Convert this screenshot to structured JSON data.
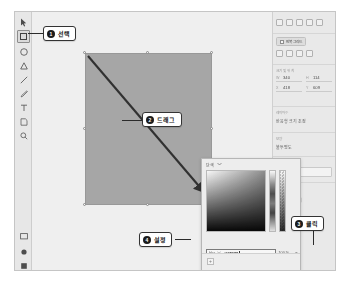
{
  "app": {
    "title": "Design Tool Canvas"
  },
  "toolbar": {
    "name": "tools-panel",
    "items": [
      {
        "icon": "cursor-icon",
        "label": "선택 도구",
        "active": false
      },
      {
        "icon": "rectangle-icon",
        "label": "사각형 도구",
        "active": true
      },
      {
        "icon": "ellipse-icon",
        "label": "타원 도구",
        "active": false
      },
      {
        "icon": "triangle-icon",
        "label": "다각형 도구",
        "active": false
      },
      {
        "icon": "line-icon",
        "label": "선 도구",
        "active": false
      },
      {
        "icon": "pen-icon",
        "label": "펜 도구",
        "active": false
      },
      {
        "icon": "text-icon",
        "label": "텍스트 도구",
        "active": false
      },
      {
        "icon": "artboard-icon",
        "label": "아트보드 도구",
        "active": false
      },
      {
        "icon": "zoom-icon",
        "label": "확대 도구",
        "active": false
      }
    ],
    "bottom_items": [
      {
        "icon": "layers-icon",
        "label": "레이어"
      },
      {
        "icon": "assets-icon",
        "label": "에셋"
      },
      {
        "icon": "plugins-icon",
        "label": "플러그인"
      }
    ]
  },
  "canvas": {
    "shape_name": "사각형",
    "fill_color": "#a8a8a8",
    "drag_hint": "드래그"
  },
  "properties": {
    "align_icons": [
      "align-left-icon",
      "align-center-horizontal-icon",
      "align-right-icon",
      "align-top-icon",
      "align-middle-icon"
    ],
    "repeat_grid": {
      "label": "반복 그리드",
      "icon": "repeat-grid-icon"
    },
    "boolean_icons": [
      "union-icon",
      "subtract-icon",
      "intersect-icon",
      "exclude-icon"
    ],
    "transform": {
      "label": "크기 및 위치",
      "fields": [
        {
          "key": "W",
          "value": "340"
        },
        {
          "key": "H",
          "value": "114"
        },
        {
          "key": "X",
          "value": "418"
        },
        {
          "key": "Y",
          "value": "609"
        }
      ]
    },
    "layout": {
      "label": "레이아웃",
      "value": "반응형 크기 조정"
    },
    "appearance": {
      "label": "모양",
      "opacity_label": "불투명도"
    },
    "fill": {
      "section_label": "배경 효과",
      "blend_value": "표준",
      "fill_label": "채우기",
      "swatch_color": "#a9a9a9"
    }
  },
  "color_picker": {
    "mode_label": "단색",
    "chevron": "chevron-down-icon",
    "hex_mode": "Hex",
    "hex_value": "#00E0FF",
    "opacity": "100 %",
    "eyedropper": "eyedropper-icon",
    "add_label": "+"
  },
  "callouts": [
    {
      "num": "1",
      "text": "선택"
    },
    {
      "num": "2",
      "text": "드래그"
    },
    {
      "num": "3",
      "text": "클릭"
    },
    {
      "num": "4",
      "text": "설정"
    }
  ]
}
